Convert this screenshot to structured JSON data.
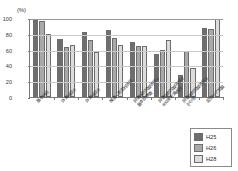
{
  "chart_data": {
    "type": "bar",
    "title": "",
    "subtitle": "",
    "xlabel": "",
    "ylabel": "(%)",
    "ylim": [
      0,
      100
    ],
    "yticks": [
      0,
      20,
      40,
      60,
      80,
      100
    ],
    "grid": true,
    "legend_position": "bottom-right",
    "categories": [
      "基本項目",
      "外来項目①",
      "外来項目②",
      "検査・測定料項目",
      "評価体制加算項目①\n基本診療費",
      "評価体制加算項目②\n400床未満病院",
      "評価体制加算項目③\nその他",
      "認知ケア加算"
    ],
    "category_lines": [
      [
        "基本項目",
        ""
      ],
      [
        "外来項目①",
        ""
      ],
      [
        "外来項目②",
        ""
      ],
      [
        "検査・測定料項目",
        ""
      ],
      [
        "評価体制加算項目①",
        "基本診療費"
      ],
      [
        "評価体制加算項目②",
        "400床未満病院"
      ],
      [
        "評価体制加算項目③",
        "その他"
      ],
      [
        "認知ケア加算",
        ""
      ]
    ],
    "series": [
      {
        "name": "H25",
        "color": "#6e6e6e",
        "values": [
          98,
          74,
          82,
          85,
          70,
          54,
          28,
          87
        ]
      },
      {
        "name": "H26",
        "color": "#a9a9a9",
        "values": [
          96,
          63,
          72,
          75,
          65,
          60,
          58,
          86
        ]
      },
      {
        "name": "H28",
        "color": "#dcdcdc",
        "values": [
          80,
          66,
          57,
          66,
          64,
          72,
          37,
          99
        ]
      }
    ]
  },
  "legend": {
    "entries": [
      {
        "label": "H25",
        "color": "#6e6e6e"
      },
      {
        "label": "H26",
        "color": "#a9a9a9"
      },
      {
        "label": "H28",
        "color": "#dcdcdc"
      }
    ]
  },
  "axis": {
    "unit": "(%)"
  }
}
